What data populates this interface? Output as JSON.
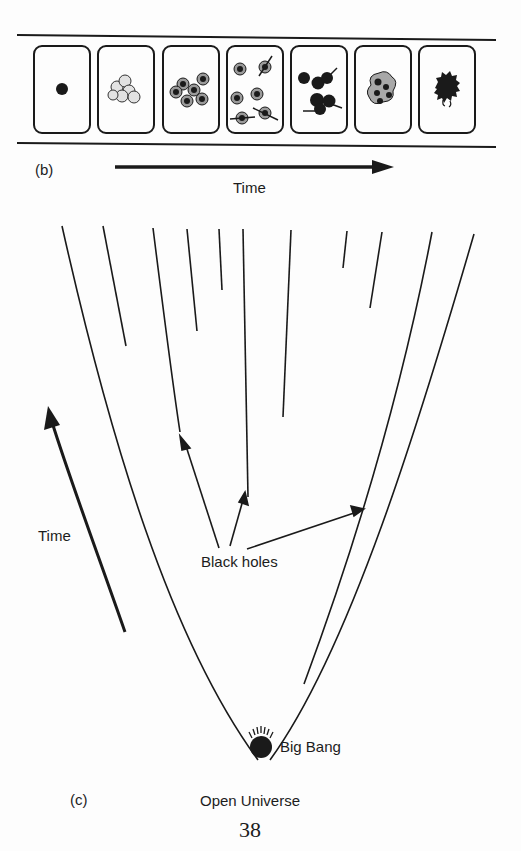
{
  "panel_b": {
    "label": "(b)",
    "axis_label": "Time",
    "frames": [
      {
        "name": "single-dense-seed"
      },
      {
        "name": "clustered-bubbles"
      },
      {
        "name": "separated-nuclei"
      },
      {
        "name": "dispersing-nuclei-with-jets"
      },
      {
        "name": "merging-dark-clumps"
      },
      {
        "name": "compact-cluster"
      },
      {
        "name": "collapsed-black-mass"
      }
    ]
  },
  "panel_c": {
    "label": "(c)",
    "title": "Open Universe",
    "time_label": "Time",
    "black_holes_label": "Black holes",
    "origin_label": "Big Bang"
  },
  "page_number": "38",
  "colors": {
    "ink": "#1a1a1a",
    "paper": "#fdfdfd",
    "bubble_fill": "#d8d8d8"
  }
}
